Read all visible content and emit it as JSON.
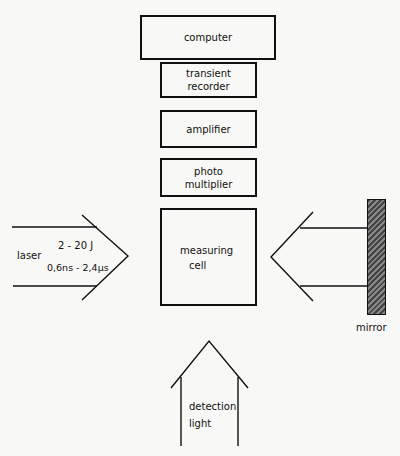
{
  "boxes": {
    "computer": "computer",
    "transient_recorder_line1": "transient",
    "transient_recorder_line2": "recorder",
    "amplifier": "amplifier",
    "photo_multiplier_line1": "photo",
    "photo_multiplier_line2": "multiplier",
    "measuring_cell_line1": "measuring",
    "measuring_cell_line2": "cell"
  },
  "laser": {
    "label": "laser",
    "energy": "2 - 20 J",
    "pulse_duration": "0,6ns - 2,4µs"
  },
  "mirror": {
    "label": "mirror"
  },
  "detection": {
    "line1": "detection",
    "line2": "light"
  }
}
